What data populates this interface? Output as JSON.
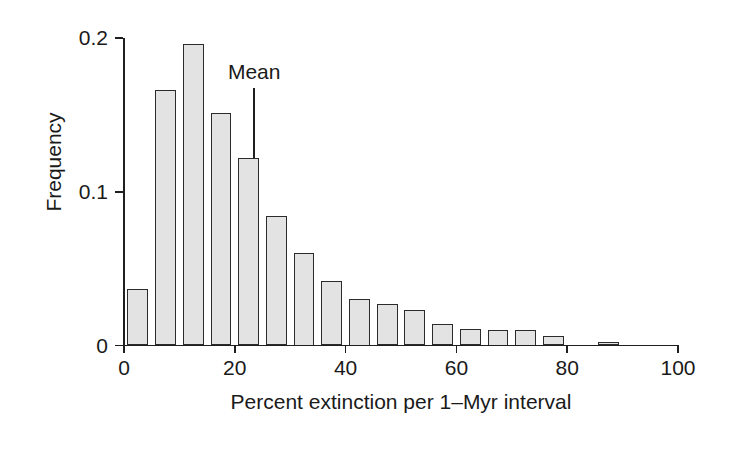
{
  "chart_data": {
    "type": "bar",
    "title": "",
    "subtitle": "",
    "xlabel": "Percent extinction per 1–Myr interval",
    "ylabel": "Frequency",
    "xlim": [
      0,
      100
    ],
    "ylim": [
      0,
      0.2
    ],
    "xticks": [
      0,
      20,
      40,
      60,
      80,
      100
    ],
    "xtick_labels": [
      "0",
      "20",
      "40",
      "60",
      "80",
      "100"
    ],
    "yticks": [
      0,
      0.1,
      0.2
    ],
    "ytick_labels": [
      "0",
      "0.1",
      "0.2"
    ],
    "grid": false,
    "legend": null,
    "bin_width": 5,
    "bin_starts": [
      0,
      5,
      10,
      15,
      20,
      25,
      30,
      35,
      40,
      45,
      50,
      55,
      60,
      65,
      70,
      75,
      85
    ],
    "categories": [
      "0-5",
      "5-10",
      "10-15",
      "15-20",
      "20-25",
      "25-30",
      "30-35",
      "35-40",
      "40-45",
      "45-50",
      "50-55",
      "55-60",
      "60-65",
      "65-70",
      "70-75",
      "75-80",
      "85-90"
    ],
    "values": [
      0.037,
      0.166,
      0.196,
      0.151,
      0.122,
      0.084,
      0.06,
      0.042,
      0.03,
      0.027,
      0.023,
      0.014,
      0.011,
      0.01,
      0.01,
      0.006,
      0.002
    ],
    "annotations": [
      {
        "label": "Mean",
        "x": 23.5,
        "type": "vertical-line-with-label"
      }
    ],
    "colors": {
      "bar_fill": "#e3e3e3",
      "bar_stroke": "#2b2b2b",
      "axis": "#1f1f1f",
      "text": "#1a1a1a",
      "background": "#ffffff"
    }
  }
}
